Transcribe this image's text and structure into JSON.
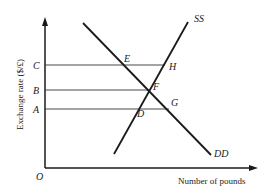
{
  "diagram": {
    "y_axis_label": "Exchange rate ($/£)",
    "x_axis_label": "Number of pounds",
    "origin_label": "O",
    "levels": [
      {
        "label": "C",
        "y": 65,
        "x_end": 165
      },
      {
        "label": "B",
        "y": 90,
        "x_end": 150
      },
      {
        "label": "A",
        "y": 109,
        "x_end": 169
      }
    ],
    "curves": {
      "supply": {
        "label": "SS",
        "x1": 114,
        "y1": 154,
        "x2": 188,
        "y2": 22
      },
      "demand": {
        "label": "DD",
        "x1": 83,
        "y1": 23,
        "x2": 211,
        "y2": 155
      }
    },
    "points": [
      {
        "label": "E",
        "x": 126,
        "y": 62
      },
      {
        "label": "H",
        "x": 170,
        "y": 71
      },
      {
        "label": "F",
        "x": 152,
        "y": 91
      },
      {
        "label": "G",
        "x": 172,
        "y": 107
      },
      {
        "label": "D",
        "x": 135,
        "y": 117
      }
    ],
    "colors": {
      "line": "#1a1a1a",
      "background": "#ffffff"
    }
  }
}
